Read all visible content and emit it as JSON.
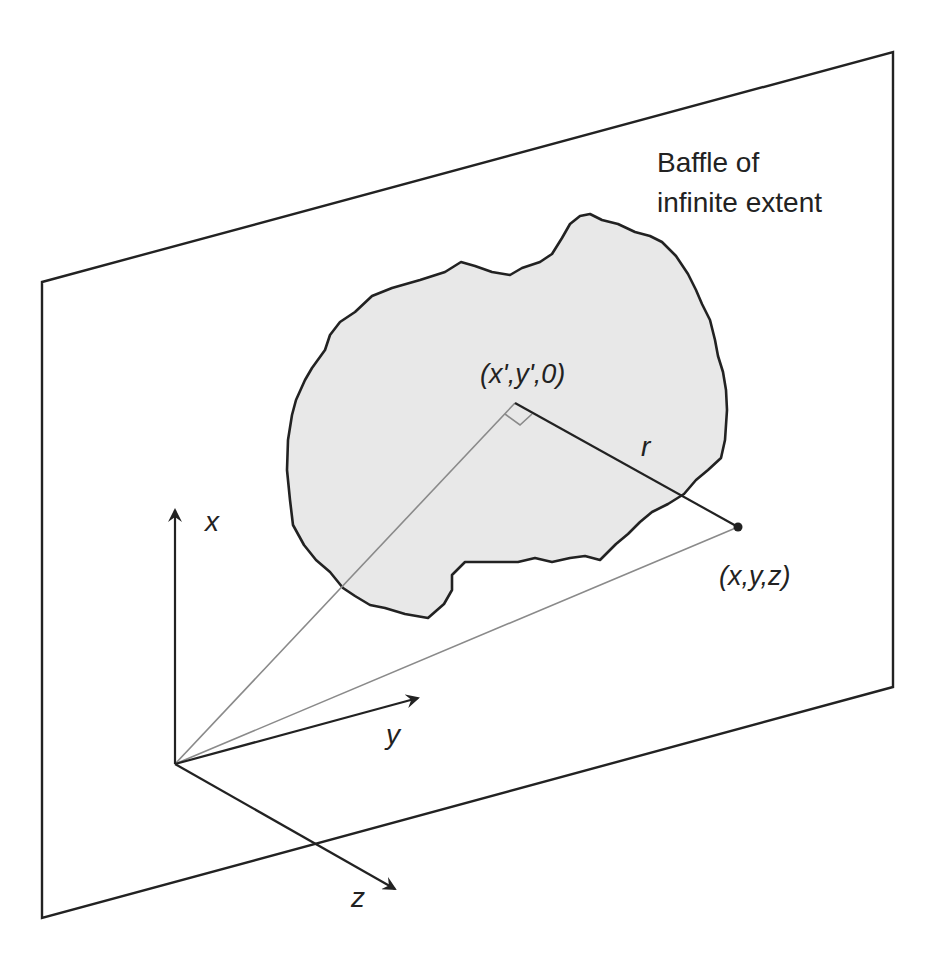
{
  "diagram": {
    "type": "geometry-figure",
    "colors": {
      "background": "#ffffff",
      "stroke": "#222222",
      "guide_line": "#8a8a8a",
      "aperture_fill": "#e8e8e8"
    },
    "baffle": {
      "label_line1": "Baffle of",
      "label_line2": "infinite extent"
    },
    "points": {
      "source_point": "(x',y',0)",
      "field_point": "(x,y,z)"
    },
    "distance_label": "r",
    "axes": {
      "x": "x",
      "y": "y",
      "z": "z"
    }
  }
}
